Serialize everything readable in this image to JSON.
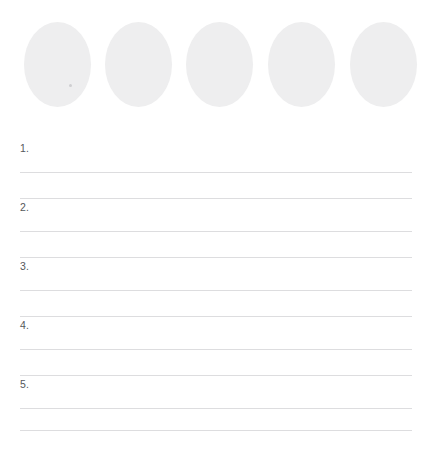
{
  "page": {
    "background_color": "#ffffff",
    "width": 431,
    "height": 454
  },
  "shapes": {
    "name": "oval",
    "count": 5,
    "fill_color": "#eeeeef",
    "items": [
      {
        "label": "1"
      },
      {
        "label": "2"
      },
      {
        "label": "3"
      },
      {
        "label": "4"
      },
      {
        "label": "5"
      }
    ]
  },
  "list": {
    "rule_color": "#dddddf",
    "number_color": "#55585b",
    "items": [
      {
        "number": "1.",
        "value": "",
        "placeholder": ""
      },
      {
        "number": "2.",
        "value": "",
        "placeholder": ""
      },
      {
        "number": "3.",
        "value": "",
        "placeholder": ""
      },
      {
        "number": "4.",
        "value": "",
        "placeholder": ""
      },
      {
        "number": "5.",
        "value": "",
        "placeholder": ""
      }
    ]
  }
}
